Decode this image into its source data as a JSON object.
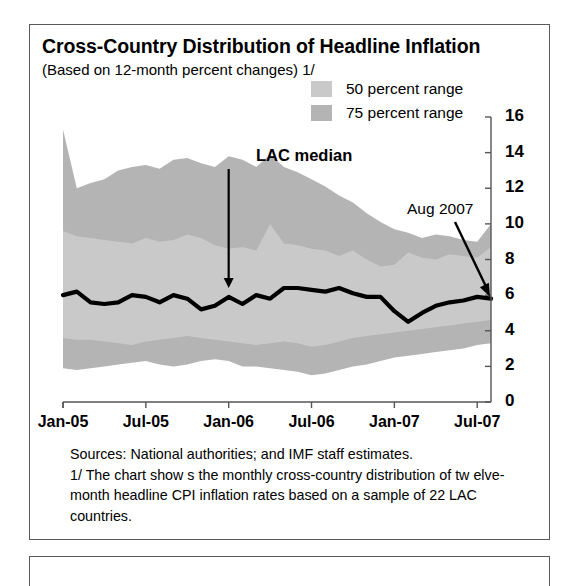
{
  "figure": {
    "title": "Cross-Country Distribution of Headline Inflation",
    "subtitle": "(Based on 12-month percent changes) 1/"
  },
  "legend": {
    "position": "top-center",
    "items": [
      {
        "label": "50 percent range",
        "color": "#c9c9c9",
        "name": "legend-swatch-50"
      },
      {
        "label": "75 percent range",
        "color": "#b4b4b4",
        "name": "legend-swatch-75"
      }
    ]
  },
  "annotations": {
    "median_label": "LAC median",
    "endpoint_label": "Aug 2007"
  },
  "footnote": {
    "sources": "Sources:  National authorities; and IMF staff estimates.",
    "note": "1/ The chart show s the monthly cross-country distribution of tw elve-month headline CPI inflation rates based on a sample of 22 LAC countries."
  },
  "colors": {
    "band_50": "#c9c9c9",
    "band_75": "#b4b4b4",
    "median_line": "#000000",
    "axis": "#555555",
    "frame": "#5a5a5a"
  },
  "chart_data": {
    "type": "area",
    "title": "Cross-Country Distribution of Headline Inflation",
    "subtitle": "(Based on 12-month percent changes) 1/",
    "xlabel": "",
    "ylabel": "",
    "ylim": [
      0,
      16
    ],
    "yticks": [
      0,
      2,
      4,
      6,
      8,
      10,
      12,
      14,
      16
    ],
    "y_axis_side": "right",
    "grid": false,
    "xticks": [
      "Jan-05",
      "Jul-05",
      "Jan-06",
      "Jul-06",
      "Jan-07",
      "Jul-07"
    ],
    "xtick_indices": [
      0,
      6,
      12,
      18,
      24,
      30
    ],
    "x": [
      "Jan-05",
      "Feb-05",
      "Mar-05",
      "Apr-05",
      "May-05",
      "Jun-05",
      "Jul-05",
      "Aug-05",
      "Sep-05",
      "Oct-05",
      "Nov-05",
      "Dec-05",
      "Jan-06",
      "Feb-06",
      "Mar-06",
      "Apr-06",
      "May-06",
      "Jun-06",
      "Jul-06",
      "Aug-06",
      "Sep-06",
      "Oct-06",
      "Nov-06",
      "Dec-06",
      "Jan-07",
      "Feb-07",
      "Mar-07",
      "Apr-07",
      "May-07",
      "Jun-07",
      "Jul-07",
      "Aug-07"
    ],
    "series": [
      {
        "name": "75 percent range",
        "type": "band",
        "color": "#b4b4b4",
        "upper": [
          15.3,
          12.0,
          12.3,
          12.5,
          13.0,
          13.2,
          13.3,
          13.1,
          13.6,
          13.7,
          13.4,
          13.2,
          13.8,
          13.6,
          13.2,
          13.9,
          13.2,
          12.9,
          12.5,
          12.1,
          11.6,
          11.2,
          10.6,
          10.1,
          9.7,
          9.5,
          9.2,
          9.4,
          9.3,
          9.1,
          9.0,
          10.0
        ],
        "lower": [
          1.9,
          1.8,
          1.9,
          2.0,
          2.1,
          2.2,
          2.3,
          2.1,
          2.0,
          2.1,
          2.3,
          2.4,
          2.3,
          2.0,
          2.0,
          1.9,
          1.8,
          1.7,
          1.5,
          1.6,
          1.8,
          2.0,
          2.1,
          2.3,
          2.5,
          2.6,
          2.7,
          2.8,
          2.9,
          3.0,
          3.2,
          3.3
        ]
      },
      {
        "name": "50 percent range",
        "type": "band",
        "color": "#c9c9c9",
        "upper": [
          9.6,
          9.3,
          9.2,
          9.1,
          9.0,
          8.9,
          9.2,
          9.0,
          9.1,
          9.4,
          9.2,
          8.8,
          8.6,
          8.7,
          8.5,
          10.0,
          8.9,
          8.8,
          8.6,
          8.5,
          8.2,
          8.5,
          8.0,
          7.6,
          7.7,
          8.4,
          8.1,
          8.0,
          8.3,
          8.2,
          8.1,
          8.7
        ],
        "lower": [
          3.6,
          3.5,
          3.5,
          3.4,
          3.3,
          3.2,
          3.4,
          3.5,
          3.6,
          3.7,
          3.6,
          3.5,
          3.4,
          3.3,
          3.2,
          3.3,
          3.4,
          3.3,
          3.1,
          3.2,
          3.4,
          3.6,
          3.7,
          3.8,
          3.9,
          4.0,
          4.1,
          4.2,
          4.3,
          4.4,
          4.5,
          4.6
        ]
      },
      {
        "name": "LAC median",
        "type": "line",
        "color": "#000000",
        "values": [
          6.0,
          6.2,
          5.6,
          5.5,
          5.6,
          6.0,
          5.9,
          5.6,
          6.0,
          5.8,
          5.2,
          5.4,
          5.9,
          5.5,
          6.0,
          5.8,
          6.4,
          6.4,
          6.3,
          6.2,
          6.4,
          6.1,
          5.9,
          5.9,
          5.1,
          4.5,
          5.0,
          5.4,
          5.6,
          5.7,
          5.9,
          5.8
        ],
        "endpoint_value": 5.8,
        "endpoint_label": "Aug 2007"
      }
    ]
  }
}
